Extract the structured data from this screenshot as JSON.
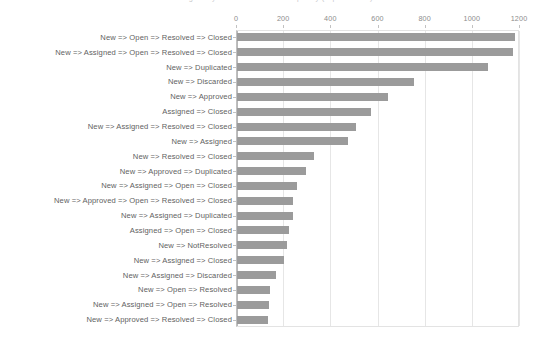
{
  "chart": {
    "title": "Bug Lifecycle Transition Path Frequency (Top 20 Paths)",
    "axis_left_px": 236,
    "axis_right_px": 519
  },
  "chart_data": {
    "type": "bar",
    "orientation": "horizontal",
    "title": "Bug Lifecycle Transition Path Frequency (Top 20 Paths)",
    "xlabel": "",
    "ylabel": "",
    "xlim": [
      0,
      1200
    ],
    "xticks": [
      0,
      200,
      400,
      600,
      800,
      1000,
      1200
    ],
    "xtick_labels": [
      "0",
      "200",
      "400",
      "600",
      "800",
      "1000",
      "1200"
    ],
    "grid": true,
    "legend": null,
    "series_color": "#9b9b9b",
    "categories": [
      "New => Open => Resolved => Closed",
      "New => Assigned => Open => Resolved => Closed",
      "New => Duplicated",
      "New => Discarded",
      "New => Approved",
      "Assigned => Closed",
      "New => Assigned => Resolved => Closed",
      "New => Assigned",
      "New => Resolved => Closed",
      "New => Approved => Duplicated",
      "New => Assigned => Open => Closed",
      "New => Approved => Open => Resolved => Closed",
      "New => Assigned => Duplicated",
      "Assigned => Open => Closed",
      "New => NotResolved",
      "New => Assigned => Closed",
      "New => Assigned => Discarded",
      "New => Open => Resolved",
      "New => Assigned => Open => Resolved",
      "New => Approved => Resolved => Closed"
    ],
    "values": [
      1178,
      1170,
      1064,
      750,
      640,
      568,
      505,
      470,
      326,
      292,
      254,
      238,
      237,
      220,
      212,
      199,
      165,
      140,
      136,
      131
    ]
  }
}
